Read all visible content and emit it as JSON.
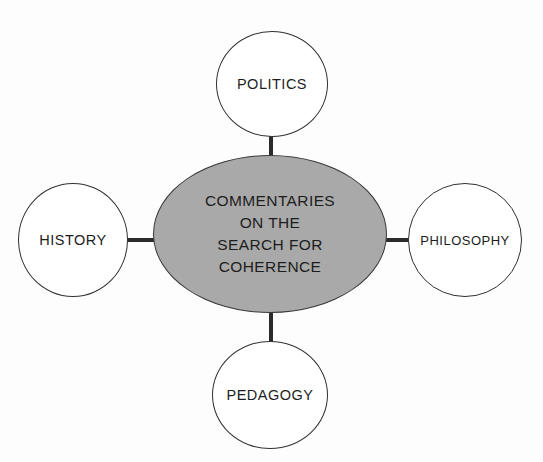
{
  "diagram": {
    "type": "hub-and-spoke",
    "background_color": "#fdfdfd",
    "center": {
      "id": "core",
      "text": "COMMENTARIES\nON THE\nSEARCH FOR\nCOHERENCE",
      "lines": [
        "COMMENTARIES",
        "ON THE",
        "SEARCH FOR",
        "COHERENCE"
      ],
      "shape": "ellipse",
      "fill_color": "#a9a9a9",
      "stroke_color": "#3a3a3a",
      "text_color": "#1d1d1d"
    },
    "nodes": [
      {
        "id": "politics",
        "label": "POLITICS",
        "position": "top",
        "shape": "ellipse",
        "fill_color": "#ffffff",
        "stroke_color": "#303030",
        "text_color": "#1d1d1d"
      },
      {
        "id": "history",
        "label": "HISTORY",
        "position": "left",
        "shape": "ellipse",
        "fill_color": "#ffffff",
        "stroke_color": "#303030",
        "text_color": "#1d1d1d"
      },
      {
        "id": "philosophy",
        "label": "PHILOSOPHY",
        "position": "right",
        "shape": "ellipse",
        "fill_color": "#ffffff",
        "stroke_color": "#303030",
        "text_color": "#1d1d1d"
      },
      {
        "id": "pedagogy",
        "label": "PEDAGOGY",
        "position": "bottom",
        "shape": "ellipse",
        "fill_color": "#ffffff",
        "stroke_color": "#303030",
        "text_color": "#1d1d1d"
      }
    ],
    "connectors": [
      {
        "id": "conn-top",
        "from": "core",
        "to": "politics",
        "orientation": "vertical",
        "color": "#2b2b2b"
      },
      {
        "id": "conn-bottom",
        "from": "core",
        "to": "pedagogy",
        "orientation": "vertical",
        "color": "#2b2b2b"
      },
      {
        "id": "conn-left",
        "from": "core",
        "to": "history",
        "orientation": "horizontal",
        "color": "#2b2b2b"
      },
      {
        "id": "conn-right",
        "from": "core",
        "to": "philosophy",
        "orientation": "horizontal",
        "color": "#2b2b2b"
      }
    ]
  }
}
